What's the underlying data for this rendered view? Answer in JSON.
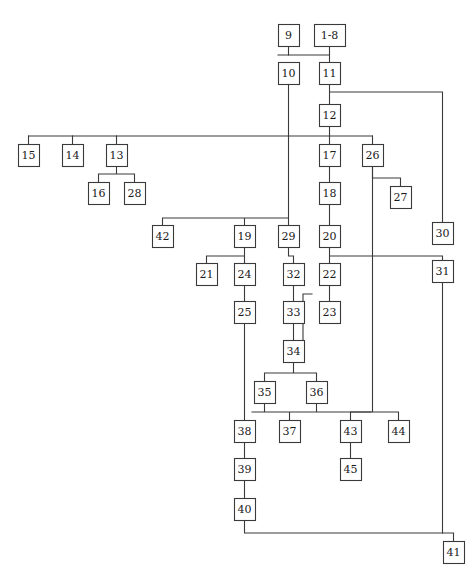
{
  "diagram": {
    "type": "hierarchical-tree-graph",
    "title": "",
    "background_color": "#ffffff",
    "line_color": "#3a3a3a",
    "box_fill": "#ffffff",
    "text_color": "#1a1a1a",
    "node_count": 45,
    "nodes": [
      {
        "id": "n9",
        "label": "9",
        "x": 278,
        "y": 24,
        "w": 21,
        "h": 22
      },
      {
        "id": "n18",
        "label": "1-8",
        "x": 314,
        "y": 24,
        "w": 31,
        "h": 22
      },
      {
        "id": "n10",
        "label": "10",
        "x": 278,
        "y": 62,
        "w": 21,
        "h": 22
      },
      {
        "id": "n11",
        "label": "11",
        "x": 319,
        "y": 62,
        "w": 21,
        "h": 22
      },
      {
        "id": "n12",
        "label": "12",
        "x": 319,
        "y": 104,
        "w": 21,
        "h": 22
      },
      {
        "id": "n15",
        "label": "15",
        "x": 18,
        "y": 144,
        "w": 21,
        "h": 22
      },
      {
        "id": "n14",
        "label": "14",
        "x": 62,
        "y": 144,
        "w": 21,
        "h": 22
      },
      {
        "id": "n13",
        "label": "13",
        "x": 106,
        "y": 144,
        "w": 21,
        "h": 22
      },
      {
        "id": "n17",
        "label": "17",
        "x": 319,
        "y": 144,
        "w": 21,
        "h": 22
      },
      {
        "id": "n26",
        "label": "26",
        "x": 362,
        "y": 144,
        "w": 21,
        "h": 22
      },
      {
        "id": "n16",
        "label": "16",
        "x": 88,
        "y": 182,
        "w": 21,
        "h": 22
      },
      {
        "id": "n28",
        "label": "28",
        "x": 124,
        "y": 182,
        "w": 21,
        "h": 22
      },
      {
        "id": "n18b",
        "label": "18",
        "x": 319,
        "y": 182,
        "w": 21,
        "h": 22
      },
      {
        "id": "n27",
        "label": "27",
        "x": 390,
        "y": 186,
        "w": 21,
        "h": 22
      },
      {
        "id": "n42",
        "label": "42",
        "x": 152,
        "y": 225,
        "w": 21,
        "h": 22
      },
      {
        "id": "n19",
        "label": "19",
        "x": 234,
        "y": 225,
        "w": 21,
        "h": 22
      },
      {
        "id": "n29",
        "label": "29",
        "x": 278,
        "y": 225,
        "w": 21,
        "h": 22
      },
      {
        "id": "n20",
        "label": "20",
        "x": 319,
        "y": 225,
        "w": 21,
        "h": 22
      },
      {
        "id": "n30",
        "label": "30",
        "x": 432,
        "y": 222,
        "w": 21,
        "h": 22
      },
      {
        "id": "n21",
        "label": "21",
        "x": 196,
        "y": 263,
        "w": 21,
        "h": 22
      },
      {
        "id": "n24",
        "label": "24",
        "x": 234,
        "y": 263,
        "w": 21,
        "h": 22
      },
      {
        "id": "n32",
        "label": "32",
        "x": 283,
        "y": 263,
        "w": 21,
        "h": 22
      },
      {
        "id": "n22",
        "label": "22",
        "x": 319,
        "y": 263,
        "w": 21,
        "h": 22
      },
      {
        "id": "n31",
        "label": "31",
        "x": 432,
        "y": 260,
        "w": 21,
        "h": 22
      },
      {
        "id": "n25",
        "label": "25",
        "x": 234,
        "y": 301,
        "w": 21,
        "h": 22
      },
      {
        "id": "n33",
        "label": "33",
        "x": 283,
        "y": 301,
        "w": 21,
        "h": 22
      },
      {
        "id": "n23",
        "label": "23",
        "x": 319,
        "y": 301,
        "w": 21,
        "h": 22
      },
      {
        "id": "n34",
        "label": "34",
        "x": 283,
        "y": 340,
        "w": 21,
        "h": 22
      },
      {
        "id": "n35",
        "label": "35",
        "x": 254,
        "y": 381,
        "w": 21,
        "h": 22
      },
      {
        "id": "n36",
        "label": "36",
        "x": 306,
        "y": 381,
        "w": 21,
        "h": 22
      },
      {
        "id": "n38",
        "label": "38",
        "x": 234,
        "y": 420,
        "w": 21,
        "h": 22
      },
      {
        "id": "n37",
        "label": "37",
        "x": 279,
        "y": 420,
        "w": 21,
        "h": 22
      },
      {
        "id": "n43",
        "label": "43",
        "x": 340,
        "y": 420,
        "w": 21,
        "h": 22
      },
      {
        "id": "n44",
        "label": "44",
        "x": 388,
        "y": 420,
        "w": 21,
        "h": 22
      },
      {
        "id": "n39",
        "label": "39",
        "x": 234,
        "y": 458,
        "w": 21,
        "h": 22
      },
      {
        "id": "n45",
        "label": "45",
        "x": 340,
        "y": 458,
        "w": 21,
        "h": 22
      },
      {
        "id": "n40",
        "label": "40",
        "x": 234,
        "y": 498,
        "w": 21,
        "h": 22
      },
      {
        "id": "n41",
        "label": "41",
        "x": 443,
        "y": 541,
        "w": 21,
        "h": 22
      }
    ],
    "edges": [
      {
        "from": "9",
        "to": "10",
        "path": "M288.5,46 L288.5,55 L288.5,55"
      },
      {
        "from": "1-8",
        "to": "11",
        "path": "M329.5,46 L329.5,62"
      },
      {
        "from": "9/1-8 bar",
        "to": "10",
        "path": "M278,55 L329.5,55"
      },
      {
        "from": "10",
        "to": "junction-130",
        "path": "M288.5,84 L288.5,130"
      },
      {
        "from": "11",
        "to": "12",
        "path": "M329.5,84 L329.5,104"
      },
      {
        "from": "11",
        "to": "30",
        "path": "M329.5,92 L442.5,92 L442.5,222"
      },
      {
        "from": "12",
        "to": "bar-136",
        "path": "M329.5,126 L329.5,136"
      },
      {
        "from": "bar-136",
        "to": "15/14/13",
        "path": "M28.5,136 L372.5,136"
      },
      {
        "from": "bar-136",
        "to": "17",
        "path": "M329.5,136 L329.5,144"
      },
      {
        "from": "bar-136",
        "to": "26",
        "path": "M372.5,136 L372.5,144"
      },
      {
        "from": "bar-136",
        "to": "15",
        "path": "M28.5,136 L28.5,144"
      },
      {
        "from": "bar-136",
        "to": "14",
        "path": "M72.5,136 L72.5,144"
      },
      {
        "from": "bar-136",
        "to": "13",
        "path": "M116.5,136 L116.5,144"
      },
      {
        "from": "13",
        "to": "16/28",
        "path": "M116.5,166 L116.5,174 M98.5,174 L134.5,174 M98.5,174 L98.5,182 M134.5,174 L134.5,182"
      },
      {
        "from": "17",
        "to": "18",
        "path": "M329.5,166 L329.5,182"
      },
      {
        "from": "18",
        "to": "20",
        "path": "M329.5,204 L329.5,225"
      },
      {
        "from": "26",
        "to": "27",
        "path": "M372.5,166 L372.5,178 L400.5,178 L400.5,186"
      },
      {
        "from": "26",
        "to": "junction-262",
        "path": "M372.5,166 L372.5,262"
      },
      {
        "from": "junction-130",
        "to": "29",
        "path": "M288.5,130 L288.5,225"
      },
      {
        "from": "bar-218",
        "to": "42/19",
        "path": "M162.5,218 L288.5,218 M162.5,218 L162.5,225 M244.5,218 L244.5,225"
      },
      {
        "from": "19",
        "to": "21/24",
        "path": "M244.5,247 L244.5,256 M206.5,256 L244.5,256 M206.5,256 L206.5,263 M244.5,256 L244.5,263"
      },
      {
        "from": "29",
        "to": "32",
        "path": "M288.5,247 L288.5,256 L293.5,256 L293.5,263"
      },
      {
        "from": "20",
        "to": "22",
        "path": "M329.5,247 L329.5,263"
      },
      {
        "from": "20-bar",
        "to": "31",
        "path": "M329.5,256 L442.5,256 L442.5,260"
      },
      {
        "from": "24",
        "to": "25",
        "path": "M244.5,285 L244.5,301"
      },
      {
        "from": "32",
        "to": "33",
        "path": "M293.5,285 L293.5,301"
      },
      {
        "from": "22",
        "to": "23",
        "path": "M329.5,285 L329.5,301"
      },
      {
        "from": "22",
        "to": "34",
        "path": "M312,294 L303,294 L303,340"
      },
      {
        "from": "33",
        "to": "34",
        "path": "M293.5,323 L293.5,340"
      },
      {
        "from": "25",
        "to": "38",
        "path": "M244.5,323 L244.5,420"
      },
      {
        "from": "34",
        "to": "35/36",
        "path": "M293.5,362 L293.5,373 M264.5,373 L316.5,373 M264.5,373 L264.5,381 M316.5,373 L316.5,381"
      },
      {
        "from": "35/36",
        "to": "37",
        "path": "M264.5,403 L264.5,412 M316.5,403 L316.5,412 M252,412 L371,412 M289.5,412 L289.5,420"
      },
      {
        "from": "junction-262",
        "to": "43/44",
        "path": "M372.5,262 L372.5,412 M350.5,412 L398.5,412 M350.5,412 L350.5,420 M398.5,412 L398.5,420"
      },
      {
        "from": "38",
        "to": "39",
        "path": "M244.5,442 L244.5,458"
      },
      {
        "from": "43",
        "to": "45",
        "path": "M350.5,442 L350.5,458"
      },
      {
        "from": "39",
        "to": "40",
        "path": "M244.5,480 L244.5,498"
      },
      {
        "from": "40",
        "to": "41",
        "path": "M244.5,520 L244.5,533 L453.5,533 L453.5,541"
      },
      {
        "from": "31",
        "to": "41",
        "path": "M442.5,282 L442.5,533"
      }
    ]
  }
}
